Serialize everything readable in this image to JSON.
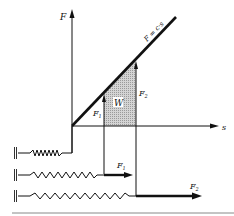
{
  "diagram": {
    "axes": {
      "y_label": "F",
      "x_label": "s"
    },
    "line_label": "F = c·s",
    "area_label": "W",
    "force_labels": {
      "f1": "F",
      "f1_sub": "1",
      "f2": "F",
      "f2_sub": "2"
    },
    "springs": [
      {
        "name": "unstretched",
        "force_label": ""
      },
      {
        "name": "stretched-to-s1",
        "force_label": "F",
        "sub": "1"
      },
      {
        "name": "stretched-to-s2",
        "force_label": "F",
        "sub": "2"
      }
    ],
    "colors": {
      "ink": "#111111",
      "shade": "#c8c8c8",
      "rule": "#888888"
    }
  }
}
